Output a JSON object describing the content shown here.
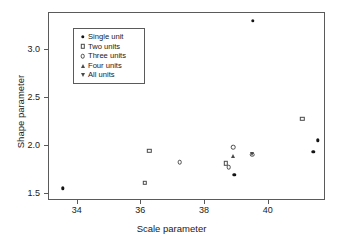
{
  "chart_data": {
    "type": "scatter",
    "title": "",
    "xlabel": "Scale parameter",
    "ylabel": "Shape parameter",
    "xlim": [
      33.1,
      41.8
    ],
    "ylim": [
      1.43,
      3.38
    ],
    "xticks": [
      34,
      36,
      38,
      40
    ],
    "xticklabels": [
      "34",
      "36",
      "38",
      "40"
    ],
    "yticks": [
      1.5,
      2.0,
      2.5,
      3.0
    ],
    "yticklabels": [
      "1.5",
      "2.0",
      "2.5",
      "3.0"
    ],
    "grid": false,
    "legend_position": "upper-left",
    "series": [
      {
        "name": "Single unit",
        "marker": "filled-circle",
        "points": [
          {
            "x": 33.54,
            "y": 1.56
          },
          {
            "x": 38.92,
            "y": 1.7
          },
          {
            "x": 39.5,
            "y": 3.3
          },
          {
            "x": 41.4,
            "y": 1.94
          },
          {
            "x": 41.55,
            "y": 2.06
          }
        ]
      },
      {
        "name": "Two units",
        "marker": "open-square",
        "points": [
          {
            "x": 36.1,
            "y": 1.62
          },
          {
            "x": 36.25,
            "y": 1.95
          },
          {
            "x": 38.65,
            "y": 1.82
          },
          {
            "x": 41.05,
            "y": 2.28
          }
        ]
      },
      {
        "name": "Three units",
        "marker": "open-circle",
        "points": [
          {
            "x": 37.2,
            "y": 1.83
          },
          {
            "x": 38.74,
            "y": 1.78
          },
          {
            "x": 38.88,
            "y": 1.99
          },
          {
            "x": 39.48,
            "y": 1.91
          }
        ]
      },
      {
        "name": "Four units",
        "marker": "open-triangle-up",
        "points": [
          {
            "x": 38.88,
            "y": 1.9
          }
        ]
      },
      {
        "name": "All units",
        "marker": "open-triangle-down",
        "points": [
          {
            "x": 39.48,
            "y": 1.92
          }
        ]
      }
    ]
  },
  "legend": {
    "entries": [
      {
        "label": "Single unit",
        "marker": "filled-circle"
      },
      {
        "label": "Two units",
        "marker": "open-square"
      },
      {
        "label": "Three units",
        "marker": "open-circle"
      },
      {
        "label": "Four units",
        "marker": "open-triangle-up"
      },
      {
        "label": "All units",
        "marker": "open-triangle-down"
      }
    ]
  }
}
